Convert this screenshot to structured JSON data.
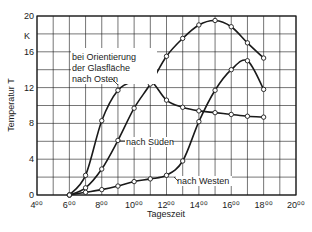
{
  "chart_data": {
    "type": "line",
    "title": "",
    "xlabel": "Tageszeit",
    "ylabel": "Temperatur T",
    "yunit": "K",
    "xlim": [
      4,
      20
    ],
    "ylim": [
      0,
      20
    ],
    "grid": true,
    "x_ticks": [
      4,
      6,
      8,
      10,
      12,
      14,
      16,
      18,
      20
    ],
    "x_tick_labels": [
      "4⁰⁰",
      "6⁰⁰",
      "8⁰⁰",
      "10⁰⁰",
      "12⁰⁰",
      "14⁰⁰",
      "16⁰⁰",
      "18⁰⁰",
      "20⁰⁰"
    ],
    "y_ticks": [
      0,
      4,
      8,
      12,
      16,
      20
    ],
    "y_tick_labels": [
      "0",
      "4",
      "8",
      "12",
      "16",
      "20"
    ],
    "legend_position": "inline annotations",
    "annotation_header": [
      "bei Orientierung",
      "der Glasfläche"
    ],
    "x": [
      6,
      7,
      8,
      9,
      10,
      11,
      12,
      13,
      14,
      15,
      16,
      17,
      18
    ],
    "series": [
      {
        "name": "nach Osten",
        "values": [
          0,
          2.2,
          8.3,
          11.7,
          12.7,
          12.8,
          10.6,
          9.8,
          9.4,
          9.2,
          9.0,
          8.8,
          8.7
        ]
      },
      {
        "name": "nach Süden",
        "values": [
          0,
          0.8,
          2.9,
          6.1,
          9.7,
          12.4,
          15.5,
          17.5,
          19.0,
          19.5,
          18.8,
          17.0,
          15.3
        ]
      },
      {
        "name": "nach Westen",
        "values": [
          0,
          0.3,
          0.6,
          1.0,
          1.5,
          1.8,
          2.2,
          3.8,
          8.2,
          11.7,
          14.0,
          15.0,
          11.8
        ]
      }
    ]
  },
  "labels": {
    "osten_line1": "bei Orientierung",
    "osten_line2": "der Glasfläche",
    "osten_line3": "nach Osten",
    "sueden": "nach Süden",
    "westen": "nach Westen",
    "unit": "K",
    "xlabel": "Tageszeit",
    "ylabel": "Temperatur T"
  },
  "colors": {
    "line": "#1a1a1a",
    "grid": "#1a1a1a",
    "marker_fill": "#ffffff"
  }
}
